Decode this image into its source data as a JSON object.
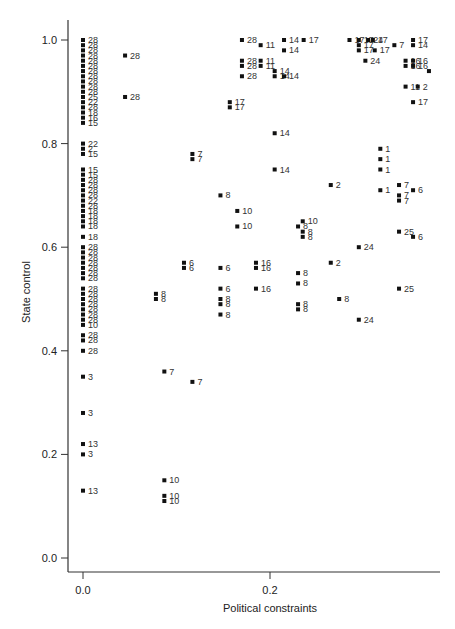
{
  "chart_data": {
    "type": "scatter",
    "title": "",
    "xlabel": "Political constraints",
    "ylabel": "State control",
    "xlim": [
      -0.005,
      0.385
    ],
    "ylim": [
      -0.03,
      1.03
    ],
    "grid": false,
    "legend": null,
    "x_ticks": [
      {
        "value": 0.0,
        "label": "0.0"
      },
      {
        "value": 0.2,
        "label": "0.2"
      }
    ],
    "y_ticks": [
      {
        "value": 0.0,
        "label": "0.0"
      },
      {
        "value": 0.2,
        "label": "0.2"
      },
      {
        "value": 0.4,
        "label": "0.4"
      },
      {
        "value": 0.6,
        "label": "0.6"
      },
      {
        "value": 0.8,
        "label": "0.8"
      },
      {
        "value": 1.0,
        "label": "1.0"
      }
    ],
    "point_style": {
      "marker": "square",
      "color": "#111111",
      "label_color": "#333333"
    },
    "points": [
      {
        "x": 0.0,
        "y": 1.0,
        "label": "28"
      },
      {
        "x": 0.0,
        "y": 0.99,
        "label": "28"
      },
      {
        "x": 0.0,
        "y": 0.98,
        "label": "28"
      },
      {
        "x": 0.0,
        "y": 0.97,
        "label": "28"
      },
      {
        "x": 0.0,
        "y": 0.96,
        "label": "28"
      },
      {
        "x": 0.0,
        "y": 0.95,
        "label": "28"
      },
      {
        "x": 0.0,
        "y": 0.94,
        "label": "28"
      },
      {
        "x": 0.0,
        "y": 0.93,
        "label": "28"
      },
      {
        "x": 0.0,
        "y": 0.92,
        "label": "28"
      },
      {
        "x": 0.0,
        "y": 0.91,
        "label": "28"
      },
      {
        "x": 0.0,
        "y": 0.9,
        "label": "28"
      },
      {
        "x": 0.0,
        "y": 0.89,
        "label": "25"
      },
      {
        "x": 0.0,
        "y": 0.88,
        "label": "22"
      },
      {
        "x": 0.0,
        "y": 0.87,
        "label": "28"
      },
      {
        "x": 0.0,
        "y": 0.86,
        "label": "18"
      },
      {
        "x": 0.0,
        "y": 0.85,
        "label": "16"
      },
      {
        "x": 0.0,
        "y": 0.84,
        "label": "15"
      },
      {
        "x": 0.0,
        "y": 0.8,
        "label": "22"
      },
      {
        "x": 0.0,
        "y": 0.79,
        "label": "2"
      },
      {
        "x": 0.0,
        "y": 0.78,
        "label": "15"
      },
      {
        "x": 0.0,
        "y": 0.75,
        "label": "15"
      },
      {
        "x": 0.0,
        "y": 0.74,
        "label": "15"
      },
      {
        "x": 0.0,
        "y": 0.73,
        "label": "28"
      },
      {
        "x": 0.0,
        "y": 0.72,
        "label": "28"
      },
      {
        "x": 0.0,
        "y": 0.71,
        "label": "28"
      },
      {
        "x": 0.0,
        "y": 0.7,
        "label": "28"
      },
      {
        "x": 0.0,
        "y": 0.69,
        "label": "22"
      },
      {
        "x": 0.0,
        "y": 0.68,
        "label": "28"
      },
      {
        "x": 0.0,
        "y": 0.67,
        "label": "18"
      },
      {
        "x": 0.0,
        "y": 0.66,
        "label": "18"
      },
      {
        "x": 0.0,
        "y": 0.65,
        "label": "18"
      },
      {
        "x": 0.0,
        "y": 0.64,
        "label": "18"
      },
      {
        "x": 0.0,
        "y": 0.62,
        "label": "18"
      },
      {
        "x": 0.0,
        "y": 0.6,
        "label": "28"
      },
      {
        "x": 0.0,
        "y": 0.59,
        "label": "28"
      },
      {
        "x": 0.0,
        "y": 0.58,
        "label": "28"
      },
      {
        "x": 0.0,
        "y": 0.57,
        "label": "28"
      },
      {
        "x": 0.0,
        "y": 0.56,
        "label": "28"
      },
      {
        "x": 0.0,
        "y": 0.55,
        "label": "28"
      },
      {
        "x": 0.0,
        "y": 0.54,
        "label": "28"
      },
      {
        "x": 0.0,
        "y": 0.52,
        "label": "28"
      },
      {
        "x": 0.0,
        "y": 0.51,
        "label": "28"
      },
      {
        "x": 0.0,
        "y": 0.5,
        "label": "28"
      },
      {
        "x": 0.0,
        "y": 0.49,
        "label": "28"
      },
      {
        "x": 0.0,
        "y": 0.48,
        "label": "28"
      },
      {
        "x": 0.0,
        "y": 0.47,
        "label": "28"
      },
      {
        "x": 0.0,
        "y": 0.46,
        "label": "28"
      },
      {
        "x": 0.0,
        "y": 0.45,
        "label": "10"
      },
      {
        "x": 0.0,
        "y": 0.43,
        "label": "28"
      },
      {
        "x": 0.0,
        "y": 0.42,
        "label": "28"
      },
      {
        "x": 0.0,
        "y": 0.4,
        "label": "28"
      },
      {
        "x": 0.0,
        "y": 0.35,
        "label": "3"
      },
      {
        "x": 0.0,
        "y": 0.28,
        "label": "3"
      },
      {
        "x": 0.0,
        "y": 0.22,
        "label": "13"
      },
      {
        "x": 0.0,
        "y": 0.2,
        "label": "3"
      },
      {
        "x": 0.0,
        "y": 0.13,
        "label": "13"
      },
      {
        "x": 0.045,
        "y": 0.97,
        "label": "28"
      },
      {
        "x": 0.045,
        "y": 0.89,
        "label": "28"
      },
      {
        "x": 0.078,
        "y": 0.51,
        "label": "8"
      },
      {
        "x": 0.078,
        "y": 0.5,
        "label": "8"
      },
      {
        "x": 0.087,
        "y": 0.36,
        "label": "7"
      },
      {
        "x": 0.087,
        "y": 0.15,
        "label": "10"
      },
      {
        "x": 0.087,
        "y": 0.12,
        "label": "10"
      },
      {
        "x": 0.087,
        "y": 0.11,
        "label": "10"
      },
      {
        "x": 0.108,
        "y": 0.57,
        "label": "6"
      },
      {
        "x": 0.108,
        "y": 0.56,
        "label": "6"
      },
      {
        "x": 0.117,
        "y": 0.78,
        "label": "7"
      },
      {
        "x": 0.117,
        "y": 0.77,
        "label": "7"
      },
      {
        "x": 0.117,
        "y": 0.34,
        "label": "7"
      },
      {
        "x": 0.147,
        "y": 0.7,
        "label": "8"
      },
      {
        "x": 0.147,
        "y": 0.56,
        "label": "6"
      },
      {
        "x": 0.147,
        "y": 0.52,
        "label": "6"
      },
      {
        "x": 0.147,
        "y": 0.5,
        "label": "8"
      },
      {
        "x": 0.147,
        "y": 0.49,
        "label": "8"
      },
      {
        "x": 0.147,
        "y": 0.47,
        "label": "8"
      },
      {
        "x": 0.157,
        "y": 0.88,
        "label": "17"
      },
      {
        "x": 0.157,
        "y": 0.87,
        "label": "17"
      },
      {
        "x": 0.165,
        "y": 0.67,
        "label": "10"
      },
      {
        "x": 0.165,
        "y": 0.64,
        "label": "10"
      },
      {
        "x": 0.185,
        "y": 0.57,
        "label": "16"
      },
      {
        "x": 0.185,
        "y": 0.56,
        "label": "16"
      },
      {
        "x": 0.185,
        "y": 0.52,
        "label": "16"
      },
      {
        "x": 0.17,
        "y": 1.0,
        "label": "28"
      },
      {
        "x": 0.17,
        "y": 0.96,
        "label": "28"
      },
      {
        "x": 0.17,
        "y": 0.95,
        "label": "28"
      },
      {
        "x": 0.17,
        "y": 0.93,
        "label": "28"
      },
      {
        "x": 0.19,
        "y": 0.99,
        "label": "11"
      },
      {
        "x": 0.19,
        "y": 0.96,
        "label": "11"
      },
      {
        "x": 0.19,
        "y": 0.95,
        "label": "11"
      },
      {
        "x": 0.205,
        "y": 0.94,
        "label": "14"
      },
      {
        "x": 0.205,
        "y": 0.93,
        "label": "14"
      },
      {
        "x": 0.205,
        "y": 0.82,
        "label": "14"
      },
      {
        "x": 0.205,
        "y": 0.75,
        "label": "14"
      },
      {
        "x": 0.215,
        "y": 1.0,
        "label": "14"
      },
      {
        "x": 0.215,
        "y": 0.98,
        "label": "14"
      },
      {
        "x": 0.215,
        "y": 0.93,
        "label": "14"
      },
      {
        "x": 0.236,
        "y": 1.0,
        "label": "17"
      },
      {
        "x": 0.235,
        "y": 0.65,
        "label": "10"
      },
      {
        "x": 0.23,
        "y": 0.64,
        "label": "8"
      },
      {
        "x": 0.235,
        "y": 0.63,
        "label": "8"
      },
      {
        "x": 0.235,
        "y": 0.62,
        "label": "8"
      },
      {
        "x": 0.23,
        "y": 0.55,
        "label": "8"
      },
      {
        "x": 0.23,
        "y": 0.53,
        "label": "8"
      },
      {
        "x": 0.23,
        "y": 0.49,
        "label": "8"
      },
      {
        "x": 0.23,
        "y": 0.48,
        "label": "8"
      },
      {
        "x": 0.265,
        "y": 0.72,
        "label": "2"
      },
      {
        "x": 0.265,
        "y": 0.57,
        "label": "2"
      },
      {
        "x": 0.274,
        "y": 0.5,
        "label": "8"
      },
      {
        "x": 0.285,
        "y": 1.0,
        "label": "17"
      },
      {
        "x": 0.295,
        "y": 1.0,
        "label": "17"
      },
      {
        "x": 0.305,
        "y": 1.0,
        "label": "24"
      },
      {
        "x": 0.31,
        "y": 1.0,
        "label": "17"
      },
      {
        "x": 0.295,
        "y": 0.99,
        "label": "17"
      },
      {
        "x": 0.295,
        "y": 0.98,
        "label": "17"
      },
      {
        "x": 0.312,
        "y": 0.98,
        "label": "17"
      },
      {
        "x": 0.302,
        "y": 0.96,
        "label": "24"
      },
      {
        "x": 0.295,
        "y": 0.6,
        "label": "24"
      },
      {
        "x": 0.295,
        "y": 0.46,
        "label": "24"
      },
      {
        "x": 0.318,
        "y": 0.79,
        "label": "1"
      },
      {
        "x": 0.318,
        "y": 0.77,
        "label": "1"
      },
      {
        "x": 0.318,
        "y": 0.75,
        "label": "1"
      },
      {
        "x": 0.318,
        "y": 0.71,
        "label": "1"
      },
      {
        "x": 0.333,
        "y": 0.99,
        "label": "7"
      },
      {
        "x": 0.338,
        "y": 0.72,
        "label": "7"
      },
      {
        "x": 0.338,
        "y": 0.7,
        "label": "7"
      },
      {
        "x": 0.338,
        "y": 0.69,
        "label": "7"
      },
      {
        "x": 0.338,
        "y": 0.63,
        "label": "25"
      },
      {
        "x": 0.338,
        "y": 0.52,
        "label": "25"
      },
      {
        "x": 0.345,
        "y": 0.96,
        "label": "16"
      },
      {
        "x": 0.345,
        "y": 0.95,
        "label": "16"
      },
      {
        "x": 0.345,
        "y": 0.91,
        "label": "11"
      },
      {
        "x": 0.353,
        "y": 1.0,
        "label": "17"
      },
      {
        "x": 0.353,
        "y": 0.99,
        "label": "14"
      },
      {
        "x": 0.353,
        "y": 0.96,
        "label": "16"
      },
      {
        "x": 0.353,
        "y": 0.95,
        "label": "16"
      },
      {
        "x": 0.353,
        "y": 0.88,
        "label": "17"
      },
      {
        "x": 0.353,
        "y": 0.71,
        "label": "6"
      },
      {
        "x": 0.353,
        "y": 0.62,
        "label": "6"
      },
      {
        "x": 0.358,
        "y": 0.91,
        "label": "2"
      },
      {
        "x": 0.37,
        "y": 0.94,
        "label": ""
      }
    ]
  }
}
